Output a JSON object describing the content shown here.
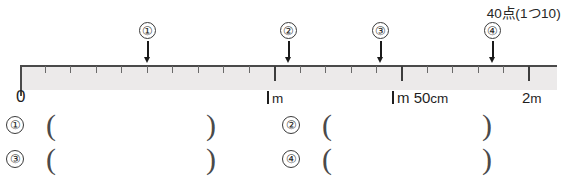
{
  "header": {
    "score_note": "40点(1つ10)"
  },
  "ruler": {
    "start_label": "0",
    "axis_labels": [
      {
        "text_one_stroke": true,
        "text": "m",
        "full": "1m"
      },
      {
        "text_one_stroke": true,
        "text": "m 50 cm",
        "full": "1m50cm"
      },
      {
        "text_one_stroke": false,
        "text": "2 m",
        "full": "2m"
      }
    ],
    "label_zero": "0",
    "label_1m_unit": "m",
    "label_1m50_unit": "m 50",
    "label_1m50_cm": "cm",
    "label_2m": "2",
    "label_2m_unit": "m",
    "markers": [
      {
        "id": "1",
        "label": "①",
        "num": "1"
      },
      {
        "id": "2",
        "label": "②",
        "num": "2"
      },
      {
        "id": "3",
        "label": "③",
        "num": "3"
      },
      {
        "id": "4",
        "label": "④",
        "num": "4"
      }
    ]
  },
  "answers": {
    "paren_open": "(",
    "paren_close": ")",
    "items": [
      {
        "num": "1",
        "label": "①",
        "value": ""
      },
      {
        "num": "2",
        "label": "②",
        "value": ""
      },
      {
        "num": "3",
        "label": "③",
        "value": ""
      },
      {
        "num": "4",
        "label": "④",
        "value": ""
      }
    ]
  },
  "colors": {
    "ink": "#231f20",
    "band": "#eceaea",
    "rule": "#4a4a4a"
  }
}
